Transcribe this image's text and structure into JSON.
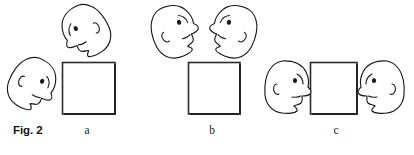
{
  "figure": {
    "caption": "Fig. 2",
    "panels": [
      {
        "id": "a",
        "label": "a",
        "label_x": 87
      },
      {
        "id": "b",
        "label": "b",
        "label_x": 212
      },
      {
        "id": "c",
        "label": "c",
        "label_x": 336
      }
    ]
  },
  "colors": {
    "background": "#ffffff",
    "ink": "#1a1a1a",
    "square_stroke": "#2b2b2b",
    "square_fill": "#ffffff",
    "caption_text": "#141414",
    "label_text": "#222222"
  },
  "squares": [
    {
      "panel": "a",
      "x": 62,
      "y": 62,
      "width": 53,
      "height": 52
    },
    {
      "panel": "b",
      "x": 188,
      "y": 62,
      "width": 52,
      "height": 52
    },
    {
      "panel": "c",
      "x": 310,
      "y": 62,
      "width": 47,
      "height": 52
    }
  ],
  "faces": [
    {
      "panel": "a",
      "name": "face-a-upper",
      "cx": 85,
      "cy": 31,
      "facing": "left",
      "rotation": -28,
      "scale": 1.0
    },
    {
      "panel": "a",
      "name": "face-a-lower-left",
      "cx": 33,
      "cy": 84,
      "facing": "right",
      "rotation": 26,
      "scale": 1.0
    },
    {
      "panel": "b",
      "name": "face-b-left",
      "cx": 175,
      "cy": 31,
      "facing": "right",
      "rotation": -22,
      "scale": 1.0
    },
    {
      "panel": "b",
      "name": "face-b-right",
      "cx": 233,
      "cy": 31,
      "facing": "left",
      "rotation": 22,
      "scale": 1.0
    },
    {
      "panel": "c",
      "name": "face-c-left",
      "cx": 288,
      "cy": 87,
      "facing": "right",
      "rotation": 0,
      "scale": 1.0
    },
    {
      "panel": "c",
      "name": "face-c-right",
      "cx": 381,
      "cy": 87,
      "facing": "left",
      "rotation": 0,
      "scale": 1.0
    }
  ]
}
